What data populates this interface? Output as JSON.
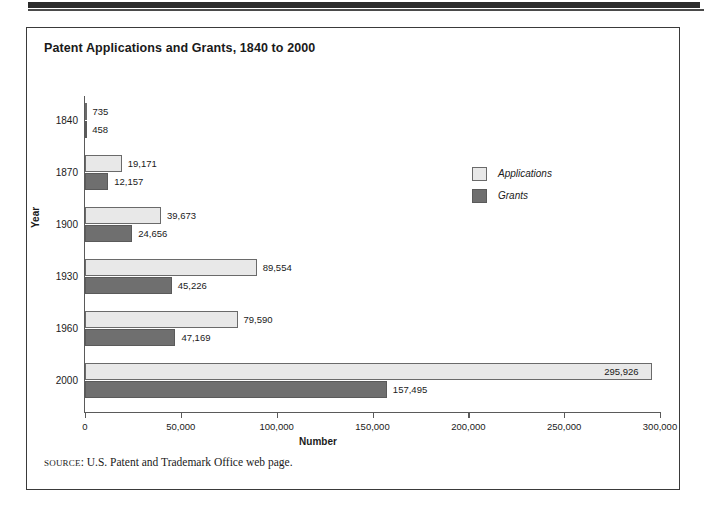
{
  "figure": {
    "title": "Patent Applications and Grants, 1840 to 2000",
    "source_label": "SOURCE",
    "source_text": ": U.S. Patent and Trademark Office web page."
  },
  "legend": {
    "items": [
      {
        "label": "Applications",
        "color": "#e8e8e8"
      },
      {
        "label": "Grants",
        "color": "#6f6f6f"
      }
    ]
  },
  "chart_data": {
    "type": "bar",
    "orientation": "horizontal",
    "title": "Patent Applications and Grants, 1840 to 2000",
    "xlabel": "Number",
    "ylabel": "Year",
    "categories": [
      "1840",
      "1870",
      "1900",
      "1930",
      "1960",
      "2000"
    ],
    "series": [
      {
        "name": "Applications",
        "color": "#e8e8e8",
        "values": [
          735,
          19171,
          39673,
          89554,
          79590,
          295926
        ],
        "labels": [
          "735",
          "19,171",
          "39,673",
          "89,554",
          "79,590",
          "295,926"
        ]
      },
      {
        "name": "Grants",
        "color": "#6f6f6f",
        "values": [
          458,
          12157,
          24656,
          45226,
          47169,
          157495
        ],
        "labels": [
          "458",
          "12,157",
          "24,656",
          "45,226",
          "47,169",
          "157,495"
        ]
      }
    ],
    "xlim": [
      0,
      300000
    ],
    "xticks": [
      0,
      50000,
      100000,
      150000,
      200000,
      250000,
      300000
    ],
    "xticklabels": [
      "0",
      "50,000",
      "100,000",
      "150,000",
      "200,000",
      "250,000",
      "300,000"
    ],
    "grid": false,
    "legend_position": "middle-right"
  }
}
